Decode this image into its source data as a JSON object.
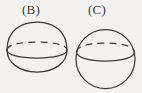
{
  "figure": {
    "background_color": "#f3f2f0",
    "stroke_color": "#3b3b3c",
    "canvas": {
      "width": 142,
      "height": 93
    },
    "items": [
      {
        "id": "shape-b",
        "label": "(B)",
        "label_position": {
          "x": 22,
          "y": 3
        },
        "shape_kind": "dome-with-rounded-base",
        "description": "Dome (upper hemisphere) over an elliptical equator with a rounded bottom cap",
        "geometry": {
          "center_x": 37,
          "equator_y": 50,
          "half_width": 30,
          "dome_top_y": 22,
          "bottom_y": 72,
          "ellipse_rx": 30,
          "ellipse_ry": 8
        },
        "equator_back_arc": "dashed",
        "equator_front_arc": "solid"
      },
      {
        "id": "shape-c",
        "label": "(C)",
        "label_position": {
          "x": 88,
          "y": 3
        },
        "shape_kind": "sphere",
        "description": "Full sphere (circle) with an elliptical equator",
        "geometry": {
          "center_x": 105.5,
          "center_y": 59,
          "radius": 29.5,
          "equator_y": 52,
          "ellipse_rx": 29,
          "ellipse_ry": 8.5
        },
        "equator_back_arc": "dashed",
        "equator_front_arc": "solid"
      }
    ]
  }
}
